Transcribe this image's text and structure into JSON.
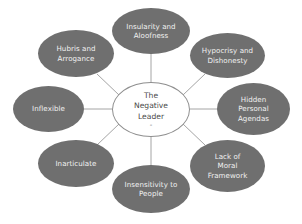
{
  "diagram": {
    "type": "hub-and-spoke",
    "title": "The Negative Leader",
    "background_color": "#ffffff",
    "satellite_fill_color": "#6f6f6f",
    "satellite_text_color": "#f2f2f2",
    "center_fill_color": "#ffffff",
    "center_text_color": "#4a4a4a",
    "center_border_color": "#8f8f8f",
    "connector_color": "#9a9a9a",
    "center": {
      "label": "The\nNegative\nLeader",
      "sub_mark": "-"
    },
    "satellites": [
      {
        "id": "insularity-and-aloofness",
        "label": "Insularity and\nAloofness"
      },
      {
        "id": "hypocrisy-and-dishonesty",
        "label": "Hypocrisy and\nDishonesty"
      },
      {
        "id": "hidden-personal-agendas",
        "label": "Hidden\nPersonal\nAgendas"
      },
      {
        "id": "lack-of-moral-framework",
        "label": "Lack of\nMoral\nFramework"
      },
      {
        "id": "insensitivity-to-people",
        "label": "Insensitivity to\nPeople"
      },
      {
        "id": "inarticulate",
        "label": "Inarticulate"
      },
      {
        "id": "inflexible",
        "label": "Inflexible"
      },
      {
        "id": "hubris-and-arrogance",
        "label": "Hubris and\nArrogance"
      }
    ]
  }
}
